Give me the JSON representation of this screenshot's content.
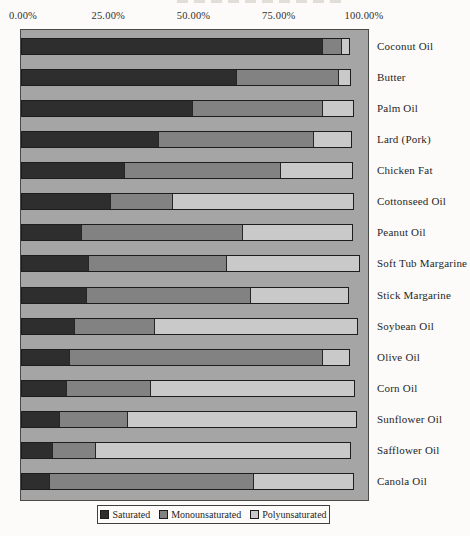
{
  "page": {
    "background_color": "#fcfbf9",
    "note": "title cropped off at top edge of image"
  },
  "x_axis": {
    "ticks": [
      {
        "label": "0.00%",
        "value": 0
      },
      {
        "label": "25.00%",
        "value": 25
      },
      {
        "label": "50.00%",
        "value": 50
      },
      {
        "label": "75.00%",
        "value": 75
      },
      {
        "label": "100.00%",
        "value": 100
      }
    ]
  },
  "legend": {
    "items": [
      {
        "label": "Saturated",
        "color": "#2e2e2e"
      },
      {
        "label": "Monounsaturated",
        "color": "#828282"
      },
      {
        "label": "Polyunsaturated",
        "color": "#c9c9c9"
      }
    ]
  },
  "chart_data": {
    "type": "bar",
    "orientation": "horizontal",
    "stacked": true,
    "unit": "%",
    "xlim": [
      0,
      100
    ],
    "x_ticks": [
      0,
      25,
      50,
      75,
      100
    ],
    "grid": false,
    "legend_position": "bottom",
    "plot_background": "#a5a5a5",
    "categories": [
      "Coconut Oil",
      "Butter",
      "Palm Oil",
      "Lard (Pork)",
      "Chicken Fat",
      "Cottonseed Oil",
      "Peanut Oil",
      "Soft Tub Margarine",
      "Stick Margarine",
      "Soybean Oil",
      "Olive Oil",
      "Corn Oil",
      "Sunflower Oil",
      "Safflower Oil",
      "Canola Oil"
    ],
    "series": [
      {
        "name": "Saturated",
        "color": "#2e2e2e",
        "values": [
          86.9,
          61.9,
          49.4,
          39.5,
          29.7,
          25.6,
          17.2,
          19.0,
          18.6,
          15.1,
          13.6,
          12.8,
          10.6,
          8.6,
          7.9
        ]
      },
      {
        "name": "Monounsaturated",
        "color": "#828282",
        "values": [
          5.5,
          29.8,
          37.5,
          44.8,
          45.0,
          18.0,
          46.5,
          40.0,
          47.4,
          23.3,
          73.3,
          24.4,
          19.8,
          12.6,
          59.1
        ]
      },
      {
        "name": "Polyunsaturated",
        "color": "#c9c9c9",
        "values": [
          2.4,
          3.5,
          9.0,
          11.0,
          20.9,
          52.3,
          32.0,
          38.8,
          28.4,
          58.7,
          7.8,
          58.9,
          66.3,
          73.9,
          28.9
        ]
      }
    ]
  }
}
